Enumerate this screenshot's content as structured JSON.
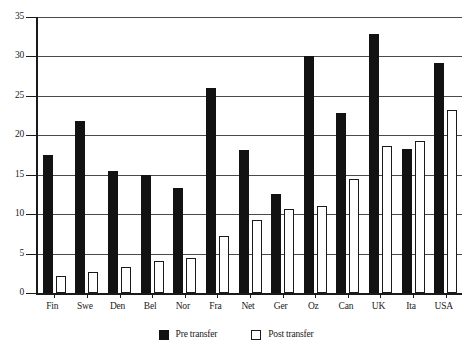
{
  "chart_data": {
    "type": "bar",
    "title": "",
    "xlabel": "",
    "ylabel": "",
    "ylim": [
      0,
      35
    ],
    "ytick_step": 5,
    "yticks": [
      "0",
      "5",
      "10",
      "15",
      "20",
      "25",
      "30",
      "35"
    ],
    "grid": true,
    "legend_position": "bottom-center",
    "categories": [
      "Fin",
      "Swe",
      "Den",
      "Bel",
      "Nor",
      "Fra",
      "Net",
      "Ger",
      "Oz",
      "Can",
      "UK",
      "Ita",
      "USA"
    ],
    "series": [
      {
        "name": "Pre transfer",
        "color": "#121212",
        "style": "filled",
        "values": [
          17.5,
          21.8,
          15.5,
          15.0,
          13.3,
          26.0,
          18.1,
          12.5,
          30.0,
          22.8,
          32.8,
          18.2,
          29.2
        ]
      },
      {
        "name": "Post transfer",
        "color": "#ffffff",
        "style": "hollow",
        "values": [
          2.1,
          2.7,
          3.3,
          4.1,
          4.4,
          7.2,
          9.3,
          10.6,
          11.0,
          14.4,
          18.7,
          19.3,
          23.2
        ]
      }
    ]
  },
  "legend": {
    "items": [
      {
        "label": "Pre transfer",
        "swatch": "filled-square-icon"
      },
      {
        "label": "Post transfer",
        "swatch": "hollow-square-icon"
      }
    ]
  }
}
